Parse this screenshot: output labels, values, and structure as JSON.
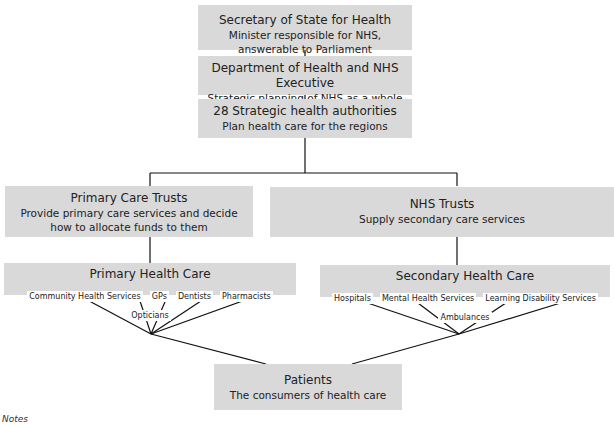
{
  "nodes": {
    "secretary": {
      "title": "Secretary of State for Health",
      "subtitle": "Minister responsible for NHS, answerable to Parliament"
    },
    "department": {
      "title": "Department of Health and NHS Executive",
      "subtitle": "Strategic planning of NHS as a whole"
    },
    "authorities": {
      "title": "28 Strategic health authorities",
      "subtitle": "Plan health care for the regions"
    },
    "pct": {
      "title": "Primary Care Trusts",
      "subtitle": "Provide primary care services and decide how to allocate funds to them"
    },
    "nhs_trusts": {
      "title": "NHS Trusts",
      "subtitle": "Supply secondary care services"
    },
    "primary": {
      "title": "Primary Health Care",
      "items": [
        "Community Health Services",
        "GPs",
        "Dentists",
        "Pharmacists",
        "Opticians"
      ]
    },
    "secondary": {
      "title": "Secondary Health Care",
      "items": [
        "Hospitals",
        "Mental Health Services",
        "Learning Disability Services",
        "Ambulances"
      ]
    },
    "patients": {
      "title": "Patients",
      "subtitle": "The consumers of health care"
    }
  },
  "notes_label": "Notes"
}
